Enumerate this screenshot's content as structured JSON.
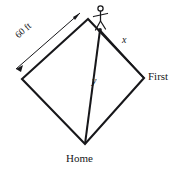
{
  "figure": {
    "type": "geometry-diagram",
    "background_color": "#ffffff",
    "line_color": "#17171a"
  },
  "labels": {
    "dimension": "60 ft",
    "segment_x": "x",
    "segment_y": "y",
    "base_first": "First",
    "base_home": "Home"
  },
  "icons": {
    "runner": "runner-stick-figure",
    "arrow_head": "arrow-head"
  },
  "geometry": {
    "vertices": {
      "second": [
        88,
        19
      ],
      "left": [
        22,
        79
      ],
      "first": [
        144,
        78
      ],
      "home": [
        85,
        144
      ]
    },
    "runner_position": [
      101,
      31
    ],
    "dimension_arrow": {
      "from": [
        15,
        70
      ],
      "to": [
        81,
        12
      ],
      "double_headed": true
    }
  }
}
